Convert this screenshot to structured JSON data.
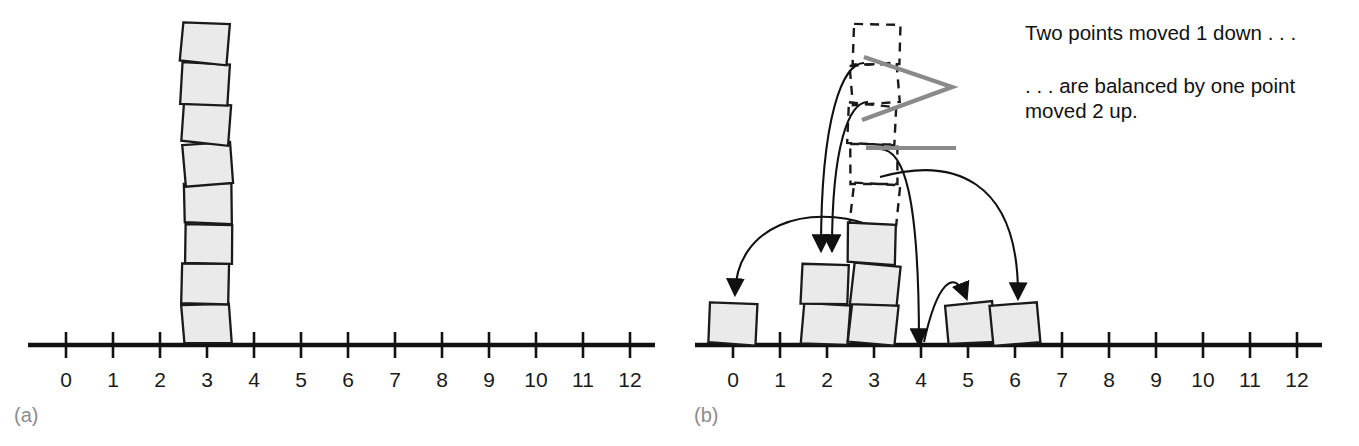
{
  "figure": {
    "background_color": "#ffffff",
    "box_fill": "#eaeaea",
    "box_stroke": "#1a1a1a",
    "axis_color": "#111111",
    "leader_color": "#8a8a8a",
    "caption_color": "#8c8c8c"
  },
  "panels": [
    {
      "id": "a",
      "caption": "(a)",
      "axis": {
        "tick_labels": [
          "0",
          "1",
          "2",
          "3",
          "4",
          "5",
          "6",
          "7",
          "8",
          "9",
          "10",
          "11",
          "12"
        ],
        "min": 0,
        "max": 12
      },
      "stacks": [
        {
          "position": 3,
          "count": 8
        }
      ],
      "ghost_stacks": [],
      "annotations": [],
      "arrows": []
    },
    {
      "id": "b",
      "caption": "(b)",
      "axis": {
        "tick_labels": [
          "0",
          "1",
          "2",
          "3",
          "4",
          "5",
          "6",
          "7",
          "8",
          "9",
          "10",
          "11",
          "12"
        ],
        "min": 0,
        "max": 12
      },
      "stacks": [
        {
          "position": 0,
          "count": 1
        },
        {
          "position": 2,
          "count": 2
        },
        {
          "position": 3,
          "count": 3
        },
        {
          "position": 5,
          "count": 1
        },
        {
          "position": 6,
          "count": 1
        }
      ],
      "ghost_stacks": [
        {
          "position": 3,
          "from_level": 3,
          "count": 5
        }
      ],
      "annotations": [
        {
          "id": "note-1",
          "text": "Two points moved 1 down . . ."
        },
        {
          "id": "note-2",
          "line1": ". . . are balanced by one point",
          "line2": "moved 2 up."
        }
      ],
      "arrows": [
        {
          "id": "arrow-to-0",
          "from_position": 3,
          "to_position": 0
        },
        {
          "id": "arrow-to-2-a",
          "from_position": 3,
          "to_position": 2
        },
        {
          "id": "arrow-to-2-b",
          "from_position": 3,
          "to_position": 2
        },
        {
          "id": "arrow-to-4",
          "from_position": 3,
          "to_position": 4
        },
        {
          "id": "arrow-to-5",
          "from_position": 4,
          "to_position": 5
        },
        {
          "id": "arrow-to-6",
          "from_position": 3,
          "to_position": 6
        }
      ]
    }
  ],
  "chart_data": {
    "type": "bar",
    "panels": [
      {
        "label": "(a)",
        "x": [
          0,
          1,
          2,
          3,
          4,
          5,
          6,
          7,
          8,
          9,
          10,
          11,
          12
        ],
        "counts": [
          0,
          0,
          0,
          8,
          0,
          0,
          0,
          0,
          0,
          0,
          0,
          0,
          0
        ],
        "xlabel": "",
        "ylabel": "",
        "mean": 3
      },
      {
        "label": "(b)",
        "x": [
          0,
          1,
          2,
          3,
          4,
          5,
          6,
          7,
          8,
          9,
          10,
          11,
          12
        ],
        "counts": [
          1,
          0,
          2,
          3,
          0,
          1,
          1,
          0,
          0,
          0,
          0,
          0,
          0
        ],
        "ghost_counts": [
          0,
          0,
          0,
          5,
          0,
          0,
          0,
          0,
          0,
          0,
          0,
          0,
          0
        ],
        "xlabel": "",
        "ylabel": "",
        "mean": 3
      }
    ],
    "annotations": [
      "Two points moved 1 down . . .",
      ". . . are balanced by one point moved 2 up."
    ],
    "grid": false,
    "legend": "none"
  }
}
